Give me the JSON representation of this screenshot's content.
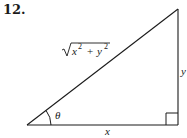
{
  "problem": {
    "number": "12."
  },
  "diagram": {
    "type": "right-triangle",
    "labels": {
      "hypotenuse": {
        "radicand_x": "x",
        "exp1": "2",
        "plus": "+",
        "radicand_y": "y",
        "exp2": "2"
      },
      "opposite": "y",
      "adjacent": "x",
      "angle": "θ"
    },
    "vertices": {
      "angle_vertex": [
        27,
        125
      ],
      "right_angle_vertex": [
        178,
        125
      ],
      "top_vertex": [
        178,
        9
      ]
    },
    "right_angle_marker": true,
    "stroke_color": "#1a1a1a"
  }
}
